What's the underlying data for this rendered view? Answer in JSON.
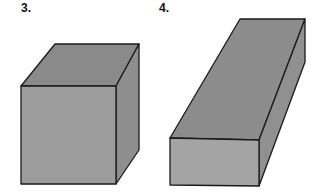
{
  "figures": [
    {
      "label": "3.",
      "shape": "cube",
      "colors": {
        "top": "#8a8a8a",
        "front": "#9c9c9c",
        "side": "#8e8e8e",
        "edge": "#1a1a1a"
      }
    },
    {
      "label": "4.",
      "shape": "rectangular-prism",
      "colors": {
        "top": "#8c8c8c",
        "front": "#a4a4a4",
        "side": "#909090",
        "edge": "#1a1a1a"
      }
    }
  ]
}
